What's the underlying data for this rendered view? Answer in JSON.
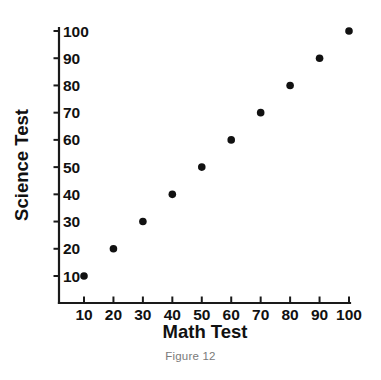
{
  "figure": {
    "caption": "Figure 12"
  },
  "chart_data": {
    "type": "scatter",
    "title": "",
    "xlabel": "Math Test",
    "ylabel": "Science Test",
    "x": [
      10,
      20,
      30,
      40,
      50,
      60,
      70,
      80,
      90,
      100
    ],
    "y": [
      10,
      20,
      30,
      40,
      50,
      60,
      70,
      80,
      90,
      100
    ],
    "points": [
      {
        "x": 10,
        "y": 10
      },
      {
        "x": 20,
        "y": 20
      },
      {
        "x": 30,
        "y": 30
      },
      {
        "x": 40,
        "y": 40
      },
      {
        "x": 50,
        "y": 50
      },
      {
        "x": 60,
        "y": 60
      },
      {
        "x": 70,
        "y": 70
      },
      {
        "x": 80,
        "y": 80
      },
      {
        "x": 90,
        "y": 90
      },
      {
        "x": 100,
        "y": 100
      }
    ],
    "xlim": [
      5,
      105
    ],
    "ylim": [
      5,
      105
    ],
    "xticks": [
      10,
      20,
      30,
      40,
      50,
      60,
      70,
      80,
      90,
      100
    ],
    "yticks": [
      10,
      20,
      30,
      40,
      50,
      60,
      70,
      80,
      90,
      100
    ],
    "xticklabels": [
      "10",
      "20",
      "30",
      "40",
      "50",
      "60",
      "70",
      "80",
      "90",
      "100"
    ],
    "yticklabels": [
      "10",
      "20",
      "30",
      "40",
      "50",
      "60",
      "70",
      "80",
      "90",
      "100"
    ],
    "grid": false,
    "legend": null,
    "marker_color": "#111111",
    "axis_color": "#1a1a1a",
    "tick_direction": "out",
    "background": "#ffffff"
  }
}
